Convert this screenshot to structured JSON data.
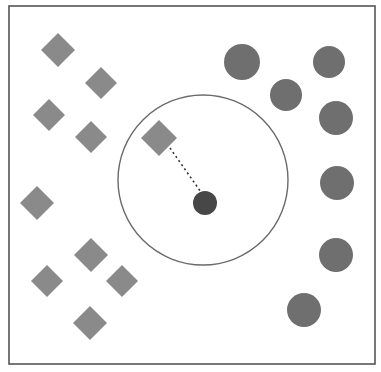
{
  "figure": {
    "width": 381,
    "height": 372,
    "background_color": "#ffffff"
  },
  "frame": {
    "name": "plot-border",
    "x": 9,
    "y": 6,
    "width": 366,
    "height": 358,
    "stroke_color": "#555555",
    "stroke_width": 1.6
  },
  "classes": [
    {
      "id": "class-a",
      "marker": "diamond",
      "fill_color": "#8a8a8a",
      "count": 10
    },
    {
      "id": "class-b",
      "marker": "circle",
      "fill_color": "#6f6f6f",
      "count": 8
    },
    {
      "id": "query",
      "marker": "circle",
      "fill_color": "#474747",
      "count": 1
    }
  ],
  "neighborhood": {
    "name": "neighborhood-boundary",
    "cx": 203,
    "cy": 180,
    "r": 85,
    "stroke_color": "#6a6a6a",
    "stroke_width": 1.4
  },
  "connector": {
    "name": "nearest-neighbour-link",
    "x1": 170,
    "y1": 148,
    "x2": 203,
    "y2": 195,
    "stroke_color": "#333333",
    "stroke_width": 1.6,
    "dash": "2 3"
  },
  "query_point": {
    "name": "query-point",
    "cx": 205,
    "cy": 203,
    "r": 12,
    "fill_color": "#474747"
  },
  "chart_data": {
    "type": "scatter",
    "xlabel": "",
    "ylabel": "",
    "xlim": [
      9,
      375
    ],
    "ylim": [
      6,
      364
    ],
    "grid": false,
    "legend": "none",
    "axes_visible": false,
    "series": [
      {
        "name": "class-a",
        "marker": "diamond",
        "color": "#8a8a8a",
        "points": [
          {
            "x": 58,
            "y": 50,
            "size": 17
          },
          {
            "x": 101,
            "y": 83,
            "size": 16
          },
          {
            "x": 49,
            "y": 115,
            "size": 16
          },
          {
            "x": 91,
            "y": 137,
            "size": 16
          },
          {
            "x": 159,
            "y": 138,
            "size": 18
          },
          {
            "x": 37,
            "y": 203,
            "size": 17
          },
          {
            "x": 91,
            "y": 255,
            "size": 17
          },
          {
            "x": 47,
            "y": 281,
            "size": 16
          },
          {
            "x": 122,
            "y": 281,
            "size": 16
          },
          {
            "x": 90,
            "y": 323,
            "size": 17
          }
        ]
      },
      {
        "name": "class-b",
        "marker": "circle",
        "color": "#6f6f6f",
        "points": [
          {
            "x": 242,
            "y": 62,
            "size": 18
          },
          {
            "x": 329,
            "y": 62,
            "size": 16
          },
          {
            "x": 286,
            "y": 95,
            "size": 16
          },
          {
            "x": 336,
            "y": 118,
            "size": 17
          },
          {
            "x": 337,
            "y": 183,
            "size": 17
          },
          {
            "x": 336,
            "y": 255,
            "size": 17
          },
          {
            "x": 304,
            "y": 310,
            "size": 17
          }
        ]
      },
      {
        "name": "query",
        "marker": "circle",
        "color": "#474747",
        "points": [
          {
            "x": 205,
            "y": 203,
            "size": 12
          }
        ]
      }
    ],
    "annotations": [
      {
        "type": "circle",
        "name": "neighborhood-boundary",
        "cx": 203,
        "cy": 180,
        "r": 85,
        "color": "#6a6a6a"
      },
      {
        "type": "dashed-segment",
        "name": "nearest-neighbour-link",
        "x1": 170,
        "y1": 148,
        "x2": 203,
        "y2": 195,
        "color": "#333333"
      }
    ]
  }
}
